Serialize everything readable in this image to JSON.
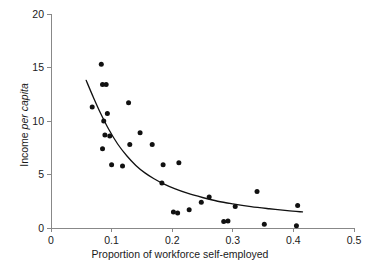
{
  "chart_data": {
    "type": "scatter",
    "title": "",
    "xlabel": "Proportion of workforce self-employed",
    "ylabel": "Income per capita",
    "ylabel_plain": "Income ",
    "ylabel_italic": "per capita",
    "xlim": [
      0,
      0.5
    ],
    "ylim": [
      0,
      20
    ],
    "xticks": [
      0,
      0.1,
      0.2,
      0.3,
      0.4,
      0.5
    ],
    "xtick_labels": [
      "0",
      "0.1",
      "0.2",
      "0.3",
      "0.4",
      "0.5"
    ],
    "yticks": [
      0,
      5,
      10,
      15,
      20
    ],
    "ytick_labels": [
      "0",
      "5",
      "10",
      "15",
      "20"
    ],
    "grid": false,
    "legend": false,
    "marker_color": "#111111",
    "curve_color": "#111111",
    "axis_color": "#888888",
    "background": "#ffffff",
    "points": [
      {
        "x": 0.068,
        "y": 11.3
      },
      {
        "x": 0.083,
        "y": 15.3
      },
      {
        "x": 0.085,
        "y": 13.4
      },
      {
        "x": 0.091,
        "y": 13.4
      },
      {
        "x": 0.087,
        "y": 10.0
      },
      {
        "x": 0.093,
        "y": 10.7
      },
      {
        "x": 0.085,
        "y": 7.4
      },
      {
        "x": 0.089,
        "y": 8.7
      },
      {
        "x": 0.097,
        "y": 8.6
      },
      {
        "x": 0.1,
        "y": 5.9
      },
      {
        "x": 0.118,
        "y": 5.8
      },
      {
        "x": 0.128,
        "y": 11.7
      },
      {
        "x": 0.13,
        "y": 7.8
      },
      {
        "x": 0.147,
        "y": 8.9
      },
      {
        "x": 0.167,
        "y": 7.8
      },
      {
        "x": 0.183,
        "y": 4.2
      },
      {
        "x": 0.185,
        "y": 5.9
      },
      {
        "x": 0.202,
        "y": 1.5
      },
      {
        "x": 0.209,
        "y": 1.4
      },
      {
        "x": 0.211,
        "y": 6.1
      },
      {
        "x": 0.228,
        "y": 1.7
      },
      {
        "x": 0.248,
        "y": 2.4
      },
      {
        "x": 0.261,
        "y": 2.9
      },
      {
        "x": 0.285,
        "y": 0.6
      },
      {
        "x": 0.292,
        "y": 0.65
      },
      {
        "x": 0.304,
        "y": 2.0
      },
      {
        "x": 0.34,
        "y": 3.4
      },
      {
        "x": 0.352,
        "y": 0.35
      },
      {
        "x": 0.405,
        "y": 0.2
      },
      {
        "x": 0.407,
        "y": 2.1
      }
    ],
    "fit_curve": {
      "label": "fitted decay curve",
      "x_start": 0.058,
      "x_end": 0.415,
      "y_start": 13.8,
      "y_end": 1.5,
      "points": [
        {
          "x": 0.058,
          "y": 13.8
        },
        {
          "x": 0.07,
          "y": 12.2
        },
        {
          "x": 0.082,
          "y": 10.7
        },
        {
          "x": 0.095,
          "y": 9.25
        },
        {
          "x": 0.11,
          "y": 7.85
        },
        {
          "x": 0.125,
          "y": 6.75
        },
        {
          "x": 0.14,
          "y": 5.85
        },
        {
          "x": 0.155,
          "y": 5.15
        },
        {
          "x": 0.17,
          "y": 4.6
        },
        {
          "x": 0.185,
          "y": 4.15
        },
        {
          "x": 0.205,
          "y": 3.65
        },
        {
          "x": 0.225,
          "y": 3.25
        },
        {
          "x": 0.25,
          "y": 2.85
        },
        {
          "x": 0.275,
          "y": 2.5
        },
        {
          "x": 0.3,
          "y": 2.25
        },
        {
          "x": 0.33,
          "y": 2.0
        },
        {
          "x": 0.36,
          "y": 1.8
        },
        {
          "x": 0.39,
          "y": 1.62
        },
        {
          "x": 0.415,
          "y": 1.5
        }
      ]
    }
  }
}
